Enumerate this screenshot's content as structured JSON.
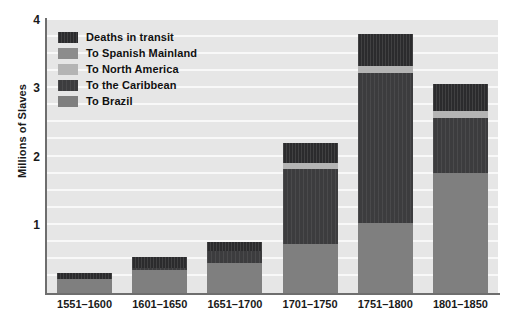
{
  "chart_data": {
    "type": "bar",
    "title": "",
    "subtitle": "",
    "xlabel": "",
    "ylabel": "Millions of Slaves",
    "stacked": true,
    "grid": true,
    "grid_orientation": "horizontal",
    "legend_position": "upper-left-inside",
    "ylim": [
      0,
      4
    ],
    "yticks": [
      0,
      1,
      2,
      3,
      4
    ],
    "ytick_labels": [
      "",
      "1",
      "2",
      "3",
      "4"
    ],
    "gridline_step": 0.25,
    "categories": [
      "1551–1600",
      "1601–1650",
      "1651–1700",
      "1701–1750",
      "1751–1800",
      "1801–1850"
    ],
    "series": [
      {
        "name": "To Brazil",
        "color": "#7f7f7f",
        "values": [
          0.2,
          0.33,
          0.44,
          0.72,
          1.02,
          1.76
        ]
      },
      {
        "name": "To the Caribbean",
        "color": "#3c3c3e",
        "values": [
          0.0,
          0.04,
          0.18,
          1.09,
          2.2,
          0.8
        ]
      },
      {
        "name": "To North America",
        "color": "#b4b4b4",
        "values": [
          0.0,
          0.0,
          0.0,
          0.1,
          0.1,
          0.1
        ]
      },
      {
        "name": "To Spanish Mainland",
        "color": "#8c8c8c",
        "values": [
          0.0,
          0.0,
          0.0,
          0.0,
          0.0,
          0.0
        ]
      },
      {
        "name": "Deaths in transit",
        "color": "#2b2b2d",
        "values": [
          0.09,
          0.16,
          0.13,
          0.29,
          0.47,
          0.41
        ]
      }
    ],
    "totals": [
      0.29,
      0.53,
      0.75,
      2.2,
      3.79,
      3.07
    ]
  },
  "legend": {
    "items": [
      {
        "label": "Deaths in transit",
        "swatch": "legend-swatch-deaths"
      },
      {
        "label": "To Spanish Mainland",
        "swatch": "legend-swatch-spanish"
      },
      {
        "label": "To North America",
        "swatch": "legend-swatch-north-america"
      },
      {
        "label": "To the Caribbean",
        "swatch": "legend-swatch-caribbean"
      },
      {
        "label": "To Brazil",
        "swatch": "legend-swatch-brazil"
      }
    ]
  },
  "colors": {
    "deaths": "#2b2b2d",
    "spanish_mainland": "#8c8c8c",
    "north_america": "#b4b4b4",
    "caribbean": "#3c3c3e",
    "brazil": "#7f7f7f",
    "plot_background": "#e6e6e6",
    "gridline": "#f8f8f8",
    "axis": "#6e6e6e",
    "text": "#1a1a1a"
  }
}
